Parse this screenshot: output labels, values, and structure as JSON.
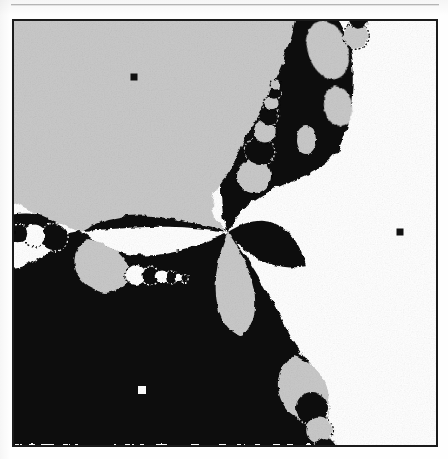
{
  "page": {
    "background_color": "#fefefe",
    "rule": {
      "color": "#b9b9b9",
      "label": "horizontal-rule"
    }
  },
  "figure": {
    "border_color": "#1b1b1b",
    "border_width": 2,
    "caption": ""
  },
  "chart_data": {
    "type": "heatmap",
    "title": "",
    "subtitle": "",
    "xlabel": "",
    "ylabel": "",
    "grid": false,
    "legend_position": "none",
    "plane": {
      "xlim": [
        -1.0,
        1.0
      ],
      "ylim": [
        -1.0,
        1.0
      ]
    },
    "basin_colors": {
      "basin_1": "#ffffff",
      "basin_2": "#c9c9c9",
      "basin_3": "#0d0d0d"
    },
    "basin_names": [
      "white-basin",
      "gray-basin",
      "black-basin"
    ],
    "roots": [
      {
        "name": "root-upper-left",
        "marker": "square",
        "marker_color": "#111111",
        "marker_size": 7,
        "px": [
          134,
          77
        ],
        "xy": [
          -0.44,
          0.62
        ]
      },
      {
        "name": "root-right",
        "marker": "square",
        "marker_color": "#111111",
        "marker_size": 7,
        "px": [
          400,
          232
        ],
        "xy": [
          0.81,
          -0.1
        ]
      },
      {
        "name": "root-lower-left",
        "marker": "square",
        "marker_color": "#ffffff",
        "marker_size": 8,
        "px": [
          142,
          390
        ],
        "xy": [
          -0.4,
          -0.85
        ]
      }
    ],
    "pinch_points": [
      {
        "name": "central-pinch",
        "px": [
          228,
          232
        ],
        "sectors": 6
      },
      {
        "name": "left-pinch",
        "px": [
          80,
          231
        ],
        "sectors": 6
      },
      {
        "name": "upper-pinch",
        "px": [
          312,
          88
        ],
        "sectors": 4
      },
      {
        "name": "lower-pinch",
        "px": [
          300,
          352
        ],
        "sectors": 4
      }
    ],
    "boundary_axis": {
      "name": "main-diagonal-boundary",
      "description": "Primary basin boundary runs from upper-right to lower-right through the central pinch, with bulb chains budding off it.",
      "px_path": [
        [
          330,
          19
        ],
        [
          300,
          110
        ],
        [
          250,
          180
        ],
        [
          228,
          232
        ],
        [
          270,
          300
        ],
        [
          300,
          352
        ],
        [
          330,
          430
        ]
      ]
    },
    "bulb_chain_counts": {
      "upper_chain": 7,
      "left_chain": 9,
      "lower_chain": 8
    }
  },
  "markers": {
    "upper_left_label": "root-marker-1",
    "right_label": "root-marker-2",
    "lower_left_label": "root-marker-3"
  }
}
